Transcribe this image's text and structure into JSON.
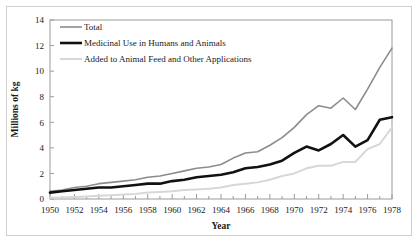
{
  "chart_data": {
    "type": "line",
    "title": "",
    "xlabel": "Year",
    "ylabel": "Millions of kg",
    "xlim": [
      1950,
      1978
    ],
    "ylim": [
      0,
      14
    ],
    "yticks": [
      0,
      2,
      4,
      6,
      8,
      10,
      12,
      14
    ],
    "xticks": [
      1950,
      1952,
      1954,
      1956,
      1958,
      1960,
      1962,
      1964,
      1966,
      1968,
      1970,
      1972,
      1974,
      1976,
      1978
    ],
    "grid": false,
    "legend_position": "upper-left",
    "x": [
      1950,
      1951,
      1952,
      1953,
      1954,
      1955,
      1956,
      1957,
      1958,
      1959,
      1960,
      1961,
      1962,
      1963,
      1964,
      1965,
      1966,
      1967,
      1968,
      1969,
      1970,
      1971,
      1972,
      1973,
      1974,
      1975,
      1976,
      1977,
      1978
    ],
    "series": [
      {
        "name": "Total",
        "color": "#8c8c8c",
        "width": 1.6,
        "values": [
          0.6,
          0.7,
          0.9,
          1.0,
          1.2,
          1.3,
          1.4,
          1.5,
          1.7,
          1.8,
          2.0,
          2.2,
          2.4,
          2.5,
          2.7,
          3.2,
          3.6,
          3.7,
          4.2,
          4.8,
          5.6,
          6.6,
          7.3,
          7.1,
          7.9,
          7.0,
          8.6,
          10.3,
          11.8
        ]
      },
      {
        "name": "Medicinal Use in Humans and Animals",
        "color": "#111111",
        "width": 2.6,
        "values": [
          0.5,
          0.6,
          0.7,
          0.8,
          0.9,
          0.9,
          1.0,
          1.1,
          1.2,
          1.2,
          1.4,
          1.5,
          1.7,
          1.8,
          1.9,
          2.1,
          2.4,
          2.5,
          2.7,
          3.0,
          3.6,
          4.1,
          3.8,
          4.3,
          5.0,
          4.1,
          4.6,
          6.2,
          6.4
        ]
      },
      {
        "name": "Added to Animal Feed and Other Applications",
        "color": "#d7d7d7",
        "width": 2.0,
        "values": [
          0.1,
          0.12,
          0.15,
          0.2,
          0.25,
          0.3,
          0.35,
          0.4,
          0.5,
          0.55,
          0.6,
          0.7,
          0.75,
          0.8,
          0.9,
          1.1,
          1.2,
          1.3,
          1.5,
          1.8,
          2.0,
          2.4,
          2.6,
          2.6,
          2.9,
          2.9,
          3.9,
          4.3,
          5.6
        ]
      }
    ]
  },
  "legend": {
    "items": [
      {
        "label": "Total"
      },
      {
        "label": "Medicinal Use in Humans and Animals"
      },
      {
        "label": "Added to Animal Feed and Other Applications"
      }
    ]
  }
}
